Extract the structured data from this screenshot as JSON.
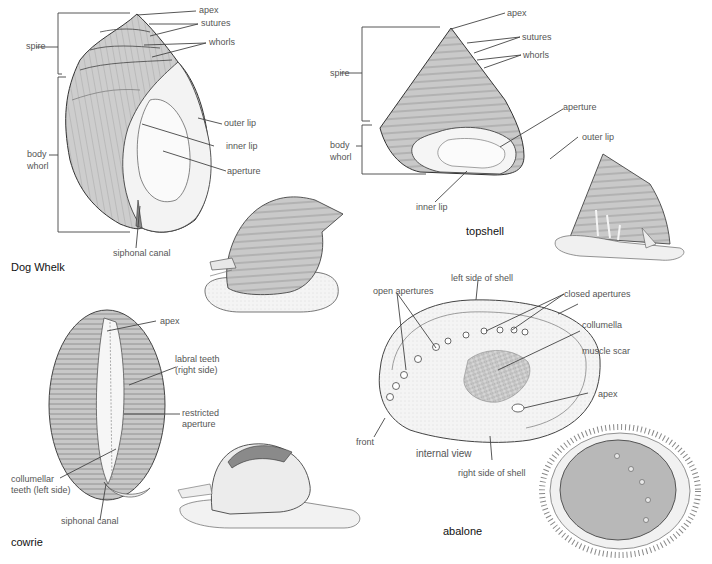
{
  "figures": {
    "dog_whelk": {
      "title": "Dog Whelk",
      "labels": {
        "apex": "apex",
        "sutures": "sutures",
        "whorls": "whorls",
        "spire": "spire",
        "body_whorl_1": "body",
        "body_whorl_2": "whorl",
        "outer_lip": "outer lip",
        "inner_lip": "inner lip",
        "aperture": "aperture",
        "siphonal_canal": "siphonal canal"
      }
    },
    "topshell": {
      "title": "topshell",
      "labels": {
        "apex": "apex",
        "sutures": "sutures",
        "whorls": "whorls",
        "spire": "spire",
        "aperture": "aperture",
        "body_whorl_1": "body",
        "body_whorl_2": "whorl",
        "outer_lip": "outer lip",
        "inner_lip": "inner lip"
      }
    },
    "cowrie": {
      "title": "cowrie",
      "labels": {
        "apex": "apex",
        "labral_teeth_1": "labral teeth",
        "labral_teeth_2": "(right side)",
        "restricted_aperture_1": "restricted",
        "restricted_aperture_2": "aperture",
        "collumellar_teeth_1": "collumellar",
        "collumellar_teeth_2": "teeth (left side)",
        "siphonal_canal": "siphonal canal"
      }
    },
    "abalone": {
      "title": "abalone",
      "labels": {
        "left_side": "left side of shell",
        "open_apertures": "open apertures",
        "closed_apertures": "closed apertures",
        "collumella": "collumella",
        "muscle_scar": "muscle scar",
        "apex": "apex",
        "front": "front",
        "internal_view": "internal view",
        "right_side": "right side of shell"
      }
    }
  },
  "colors": {
    "shell_fill": "#cfcfcf",
    "shell_light": "#f2f2f2",
    "line": "#333333",
    "label_text": "#555555",
    "title_text": "#111111"
  }
}
